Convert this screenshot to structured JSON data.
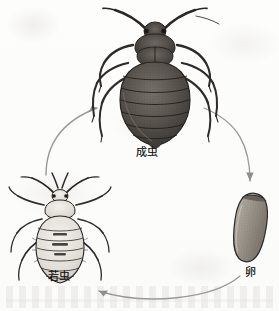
{
  "figure": {
    "kind": "scientific-illustration",
    "background_color": "#fdfdfc",
    "ink_color": "#1d1d1d",
    "arrow_color": "#8f8f8f"
  },
  "stages": [
    {
      "id": "adult",
      "label": "成虫",
      "icon": "adult-bed-bug-icon",
      "position": "top-center",
      "rendering": "dark stippled engraving, dorsal view, oval segmented abdomen, long antennae"
    },
    {
      "id": "nymph",
      "label": "若虫",
      "icon": "nymph-bed-bug-icon",
      "position": "left",
      "rendering": "pale line engraving, dorsal view, banded abdomen, splayed legs"
    },
    {
      "id": "egg",
      "label": "卵",
      "icon": "bed-bug-egg-icon",
      "position": "right",
      "rendering": "elongated stippled capsule tilted slightly right"
    }
  ],
  "arrows": [
    {
      "id": "egg-to-nymph",
      "from": "卵",
      "to": "若虫",
      "direction": "right-to-left along bottom"
    },
    {
      "id": "nymph-to-adult",
      "from": "若虫",
      "to": "成虫",
      "direction": "bottom-left up to top-center"
    },
    {
      "id": "adult-to-egg",
      "from": "成虫",
      "to": "卵",
      "direction": "top-center down to right"
    }
  ]
}
